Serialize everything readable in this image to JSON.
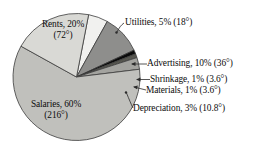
{
  "chart_data": {
    "type": "pie",
    "title": "",
    "subtitle": "",
    "xlabel": "",
    "ylabel": "",
    "legend_position": "none",
    "grid": false,
    "total_degrees": 360,
    "categories": [
      "Utilities",
      "Advertising",
      "Shrinkage",
      "Materials",
      "Depreciation",
      "Salaries",
      "Rents"
    ],
    "values": [
      5,
      10,
      1,
      1,
      3,
      60,
      20
    ],
    "degrees": [
      18,
      36,
      3.6,
      3.6,
      10.8,
      216,
      72
    ],
    "value_unit": "%",
    "slices": [
      {
        "name": "Utilities",
        "percent": 5,
        "degrees": 18,
        "color": "#f1f1ef",
        "label_line1": "Utilities, 5% (18°)",
        "label_line2": "",
        "label_placement": "outside"
      },
      {
        "name": "Advertising",
        "percent": 10,
        "degrees": 36,
        "color": "#8e8e8c",
        "label_line1": "Advertising, 10% (36°)",
        "label_line2": "",
        "label_placement": "outside"
      },
      {
        "name": "Shrinkage",
        "percent": 1,
        "degrees": 3.6,
        "color": "#0a0a0a",
        "label_line1": "Shrinkage, 1% (3.6°)",
        "label_line2": "",
        "label_placement": "outside"
      },
      {
        "name": "Materials",
        "percent": 1,
        "degrees": 3.6,
        "color": "#56564f",
        "label_line1": "Materials, 1% (3.6°)",
        "label_line2": "",
        "label_placement": "outside"
      },
      {
        "name": "Depreciation",
        "percent": 3,
        "degrees": 10.8,
        "color": "#a3a39f",
        "label_line1": "Depreciation, 3% (10.8°)",
        "label_line2": "",
        "label_placement": "outside"
      },
      {
        "name": "Salaries",
        "percent": 60,
        "degrees": 216,
        "color": "#c0c0bc",
        "label_line1": "Salaries, 60%",
        "label_line2": "(216°)",
        "label_placement": "inside"
      },
      {
        "name": "Rents",
        "percent": 20,
        "degrees": 72,
        "color": "#d9d9d5",
        "label_line1": "Rents, 20%",
        "label_line2": "(72°)",
        "label_placement": "inside"
      }
    ],
    "stroke_color": "#3b3b3b",
    "background": "#ffffff"
  }
}
